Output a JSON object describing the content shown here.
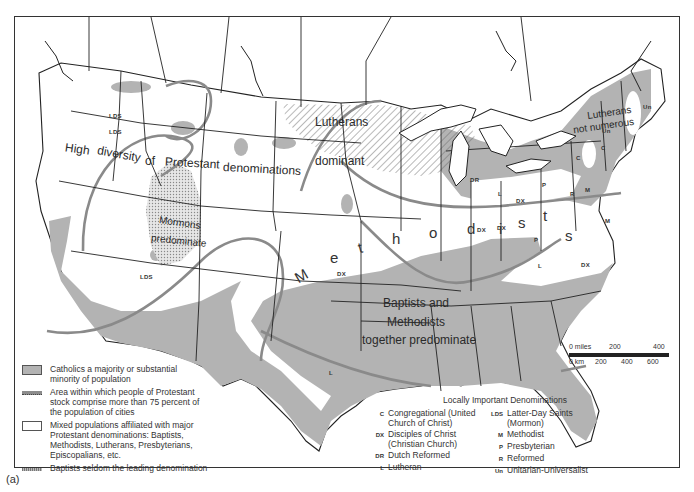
{
  "figure": {
    "caption": "(a)"
  },
  "map_labels": {
    "high_diversity": [
      "High",
      "diversity",
      "of",
      "Protestant",
      "denominations"
    ],
    "lutherans_dominant": [
      "Lutherans",
      "dominant"
    ],
    "mormons_predominate": [
      "Mormons",
      "predominate"
    ],
    "methodists_letters": [
      "M",
      "e",
      "t",
      "h",
      "o",
      "d",
      "i",
      "s",
      "t",
      "s"
    ],
    "baptists_methodists": [
      "Baptists and",
      "Methodists",
      "together predominate"
    ],
    "lutherans_not_numerous": [
      "Lutherans",
      "not numerous"
    ]
  },
  "local_markers": [
    {
      "abbr": "LDS",
      "x": 108,
      "y": 112
    },
    {
      "abbr": "LDS",
      "x": 108,
      "y": 128
    },
    {
      "abbr": "LDS",
      "x": 139,
      "y": 273
    },
    {
      "abbr": "DR",
      "x": 469,
      "y": 176
    },
    {
      "abbr": "L",
      "x": 497,
      "y": 190
    },
    {
      "abbr": "DX",
      "x": 515,
      "y": 197
    },
    {
      "abbr": "P",
      "x": 541,
      "y": 181
    },
    {
      "abbr": "R",
      "x": 569,
      "y": 190
    },
    {
      "abbr": "M",
      "x": 584,
      "y": 186
    },
    {
      "abbr": "DX",
      "x": 476,
      "y": 226
    },
    {
      "abbr": "DX",
      "x": 496,
      "y": 224
    },
    {
      "abbr": "P",
      "x": 533,
      "y": 236
    },
    {
      "abbr": "M",
      "x": 604,
      "y": 217
    },
    {
      "abbr": "L",
      "x": 537,
      "y": 262
    },
    {
      "abbr": "DX",
      "x": 580,
      "y": 261
    },
    {
      "abbr": "DX",
      "x": 336,
      "y": 270
    },
    {
      "abbr": "L",
      "x": 328,
      "y": 369
    },
    {
      "abbr": "C",
      "x": 575,
      "y": 154
    },
    {
      "abbr": "C",
      "x": 600,
      "y": 144
    },
    {
      "abbr": "Un",
      "x": 601,
      "y": 127
    },
    {
      "abbr": "Un",
      "x": 642,
      "y": 103
    },
    {
      "abbr": "S",
      "x": 520,
      "y": 215
    }
  ],
  "legend": {
    "items": [
      {
        "symbol": "catholic-shading",
        "label": "Catholics a majority or substantial minority of population"
      },
      {
        "symbol": "protestant-area-line",
        "label": "Area within which people of Protestant stock comprise more than 75 percent of the population of cities"
      },
      {
        "symbol": "mixed-white",
        "label": "Mixed populations affiliated with major Protestant denominations: Baptists, Methodists, Lutherans, Presbyterians, Episcopalians, etc."
      },
      {
        "symbol": "baptist-hatched-line",
        "label": "Baptists seldom the leading denomination"
      }
    ]
  },
  "local_denominations": {
    "title": "Locally Important Denominations",
    "left": [
      {
        "abbr": "C",
        "label": "Congregational (United Church of Christ)"
      },
      {
        "abbr": "DX",
        "label": "Disciples of Christ (Christian Church)"
      },
      {
        "abbr": "DR",
        "label": "Dutch Reformed"
      },
      {
        "abbr": "L",
        "label": "Lutheran"
      }
    ],
    "right": [
      {
        "abbr": "LDS",
        "label": "Latter-Day Saints (Mormon)"
      },
      {
        "abbr": "M",
        "label": "Methodist"
      },
      {
        "abbr": "P",
        "label": "Presbyterian"
      },
      {
        "abbr": "R",
        "label": "Reformed"
      },
      {
        "abbr": "Un",
        "label": "Unitarian-Universalist"
      }
    ]
  },
  "scale": {
    "miles_labels": [
      "0 miles",
      "200",
      "400"
    ],
    "km_labels": [
      "0 km",
      "200",
      "400",
      "600"
    ]
  },
  "colors": {
    "catholic": "#b3b3b3",
    "boundary": "#222222",
    "area_line": "#8a8a8a",
    "hatch": "#555555",
    "mormon_dots": "#c8c8c8"
  }
}
